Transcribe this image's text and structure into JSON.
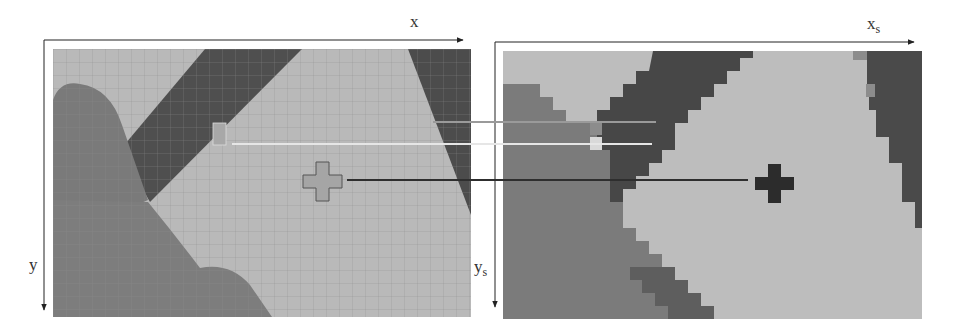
{
  "figure": {
    "left_panel": {
      "name": "full-resolution-image-with-pixel-grid",
      "x_axis_label": "x",
      "y_axis_label": "y"
    },
    "right_panel": {
      "name": "superpixel-downsampled-image",
      "x_axis_label": "x",
      "x_axis_subscript": "s",
      "y_axis_label": "y",
      "y_axis_subscript": "s"
    },
    "correspondence_lines": [
      {
        "color": "#9a9a9a",
        "y": 122
      },
      {
        "color": "#e6e6e6",
        "y": 144
      },
      {
        "color": "#2e2e2e",
        "y": 180
      }
    ],
    "colors": {
      "light_region": "#b9b9b9",
      "mid_region": "#7d7d7d",
      "dark_region": "#555555",
      "darkest_region": "#444444",
      "axis": "#222222"
    }
  }
}
